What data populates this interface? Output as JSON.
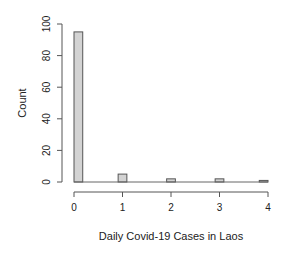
{
  "chart_data": {
    "type": "bar",
    "title": "",
    "xlabel": "Daily Covid-19 Cases in Laos",
    "ylabel": "Count",
    "categories": [
      0,
      1,
      2,
      3,
      4
    ],
    "values": [
      95,
      5,
      2,
      2,
      1
    ],
    "xticks": [
      "0",
      "1",
      "2",
      "3",
      "4"
    ],
    "yticks": [
      "0",
      "20",
      "40",
      "60",
      "80",
      "100"
    ],
    "ylim": [
      0,
      100
    ],
    "xlim": [
      0,
      4
    ],
    "grid": false,
    "legend": null,
    "bar_fill": "#d3d3d3",
    "bar_stroke": "#555555"
  }
}
